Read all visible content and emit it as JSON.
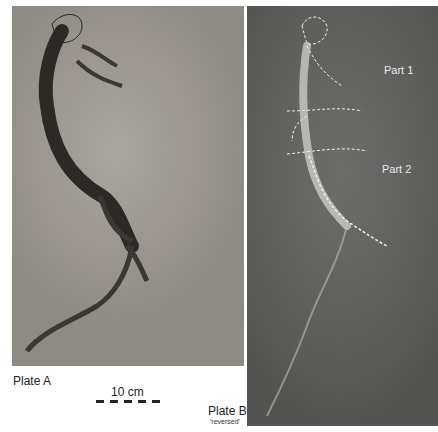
{
  "figure": {
    "plate_a": {
      "label": "Plate A"
    },
    "plate_b": {
      "label": "Plate B",
      "sublabel": "'reversed'"
    },
    "scale": {
      "label": "10 cm"
    },
    "annotations": [
      {
        "label": "Part 1"
      },
      {
        "label": "Part 2"
      }
    ]
  }
}
